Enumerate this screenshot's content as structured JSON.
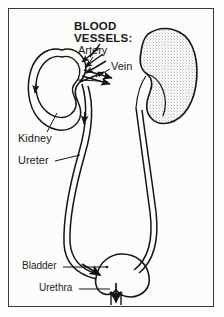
{
  "figure": {
    "frame": {
      "border_color": "#3a3a3a",
      "background_color": "#fcfcfb"
    },
    "ink_color": "#141414"
  },
  "labels": {
    "title": "BLOOD\nVESSELS:",
    "artery": "Artery",
    "vein": "Vein",
    "kidney": "Kidney",
    "ureter": "Ureter",
    "bladder": "Bladder",
    "urethra": "Urethra"
  },
  "structures": [
    {
      "name": "left-kidney",
      "style": "line-outline",
      "side": "left"
    },
    {
      "name": "right-kidney",
      "style": "stippled-shaded",
      "side": "right"
    },
    {
      "name": "renal-artery",
      "flow": "inward"
    },
    {
      "name": "renal-vein",
      "flow": "outward"
    },
    {
      "name": "left-ureter",
      "flow": "downward"
    },
    {
      "name": "right-ureter",
      "flow": "downward"
    },
    {
      "name": "bladder",
      "style": "line-outline"
    },
    {
      "name": "urethra",
      "flow": "downward-exit"
    }
  ]
}
